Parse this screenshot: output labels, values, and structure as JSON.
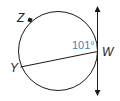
{
  "diagram": {
    "type": "circle-tangent-chord",
    "points": {
      "Z": {
        "label": "Z"
      },
      "Y": {
        "label": "Y"
      },
      "W": {
        "label": "W"
      }
    },
    "angle": {
      "label": "101°",
      "color": "#4a7fc1"
    },
    "colors": {
      "stroke": "#1a1a1a",
      "angle_text": "#4a7fc1"
    }
  }
}
